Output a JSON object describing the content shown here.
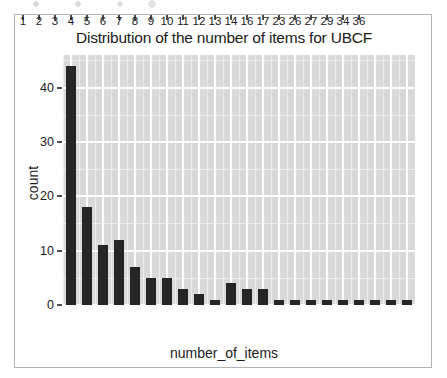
{
  "figure": {
    "background_color": "#ffffff",
    "frame_color": "#b3b3b3",
    "panel_color": "#d9d9d9",
    "grid_color": "#ffffff",
    "bar_color": "#262626"
  },
  "chart_data": {
    "type": "bar",
    "title": "Distribution of the number of items for UBCF",
    "xlabel": "number_of_items",
    "ylabel": "count",
    "categories": [
      "1",
      "2",
      "3",
      "4",
      "5",
      "6",
      "7",
      "8",
      "9",
      "10",
      "11",
      "12",
      "13",
      "14",
      "16",
      "17",
      "23",
      "26",
      "27",
      "29",
      "34",
      "36"
    ],
    "values": [
      44,
      18,
      11,
      12,
      7,
      5,
      5,
      3,
      2,
      1,
      4,
      3,
      3,
      1,
      1,
      1,
      1,
      1,
      1,
      1,
      1,
      1
    ],
    "ylim": [
      0,
      46
    ],
    "y_ticks": [
      0,
      10,
      20,
      30,
      40
    ],
    "y_tick_labels": [
      "0",
      "10",
      "20",
      "30",
      "40"
    ],
    "y_minor_ticks": [
      5,
      15,
      25,
      35,
      45
    ],
    "grid": true,
    "legend": "none",
    "series": [
      {
        "name": "count",
        "values": [
          44,
          18,
          11,
          12,
          7,
          5,
          5,
          3,
          2,
          1,
          4,
          3,
          3,
          1,
          1,
          1,
          1,
          1,
          1,
          1,
          1,
          1
        ]
      }
    ]
  }
}
